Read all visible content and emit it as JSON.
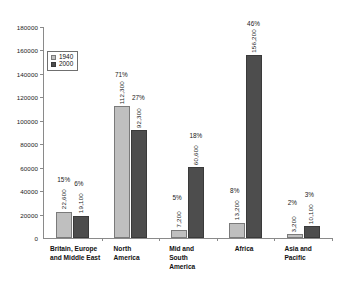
{
  "chart_data": {
    "type": "bar",
    "title": "",
    "xlabel": "",
    "ylabel": "",
    "ylim": [
      0,
      180000
    ],
    "grid": false,
    "legend_position": "inside-top-left",
    "categories": [
      "Britain, Europe\nand Middle East",
      "North\nAmerica",
      "Mid and\nSouth\nAmerica",
      "Africa",
      "Asia and\nPacific"
    ],
    "series": [
      {
        "name": "1940",
        "color": "#bfbfbf",
        "values": [
          22600,
          112300,
          7200,
          13200,
          3200
        ],
        "value_labels": [
          "22,600",
          "112,300",
          "7,200",
          "13,200",
          "3,200"
        ],
        "percent_labels": [
          "15%",
          "71%",
          "5%",
          "8%",
          "2%"
        ]
      },
      {
        "name": "2000",
        "color": "#4d4d4d",
        "values": [
          19100,
          92300,
          60600,
          156200,
          10100
        ],
        "value_labels": [
          "19,100",
          "92,300",
          "60,600",
          "156,200",
          "10,100"
        ],
        "percent_labels": [
          "6%",
          "27%",
          "18%",
          "46%",
          "3%"
        ]
      }
    ],
    "y_ticks": [
      0,
      20000,
      40000,
      60000,
      80000,
      100000,
      120000,
      140000,
      160000,
      180000
    ],
    "y_tick_labels": [
      "0",
      "20000",
      "40000",
      "60000",
      "80000",
      "100000",
      "120000",
      "140000",
      "160000",
      "180000"
    ]
  },
  "legend": {
    "items": [
      {
        "label": "1940"
      },
      {
        "label": "2000"
      }
    ]
  }
}
